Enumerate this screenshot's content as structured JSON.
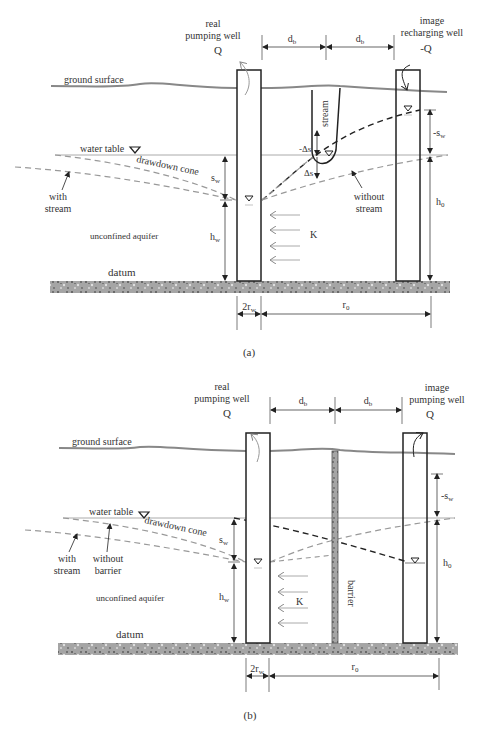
{
  "panels": [
    {
      "id": "a",
      "caption": "(a)",
      "labels": {
        "real_well": [
          "real",
          "pumping well"
        ],
        "real_q": "Q",
        "image_well": [
          "image",
          "recharging well"
        ],
        "image_q": "-Q",
        "ground_surface": "ground surface",
        "water_table": "water table",
        "drawdown_cone": "drawdown cone",
        "with_stream": [
          "with",
          "stream"
        ],
        "without_stream": [
          "without",
          "stream"
        ],
        "unconfined_aquifer": "unconfined aquifer",
        "datum": "datum",
        "stream": "stream",
        "neg_delta_s": "-Δs",
        "delta_s": "Δs",
        "s_w": "s",
        "s_w_sub": "w",
        "neg_s_w": "-s",
        "h_w": "h",
        "h_w_sub": "w",
        "h_0": "h",
        "h_0_sub": "0",
        "k": "K",
        "d_b_1": "d",
        "d_b_2": "d",
        "d_b_sub": "b",
        "two_r_w": "2r",
        "two_r_w_sub": "w",
        "r_0": "r",
        "r_0_sub": "0"
      }
    },
    {
      "id": "b",
      "caption": "(b)",
      "labels": {
        "real_well": [
          "real",
          "pumping well"
        ],
        "real_q": "Q",
        "image_well": [
          "image",
          "pumping well"
        ],
        "image_q": "Q",
        "ground_surface": "ground surface",
        "water_table": "water table",
        "drawdown_cone": "drawdown cone",
        "with_stream": [
          "with",
          "stream"
        ],
        "without_barrier": [
          "without",
          "barrier"
        ],
        "unconfined_aquifer": "unconfined aquifer",
        "datum": "datum",
        "barrier": "barrier",
        "s_w": "s",
        "s_w_sub": "w",
        "neg_s_w": "-s",
        "h_w": "h",
        "h_w_sub": "w",
        "h_0": "h",
        "h_0_sub": "0",
        "k": "K",
        "d_b_1": "d",
        "d_b_2": "d",
        "d_b_sub": "b",
        "two_r_w": "2r",
        "two_r_w_sub": "w",
        "r_0": "r",
        "r_0_sub": "0"
      }
    }
  ],
  "colors": {
    "ink": "#222222",
    "grey_line": "#8a8a8a",
    "light_grey": "#b0b0b0",
    "datum_fill": "#9a9a9a"
  }
}
